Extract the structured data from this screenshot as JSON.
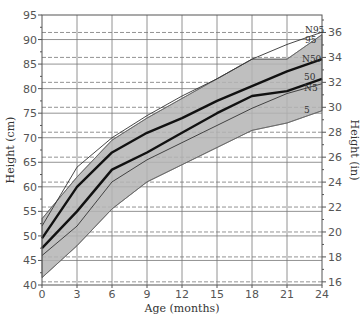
{
  "chart_data": {
    "type": "line",
    "title": "",
    "xlabel": "Age (months)",
    "ylabel": "Height (cm)",
    "ylabel_right": "Height (in)",
    "x": [
      0,
      3,
      6,
      9,
      12,
      15,
      18,
      21,
      24
    ],
    "xticks": [
      0,
      3,
      6,
      9,
      12,
      15,
      18,
      21,
      24
    ],
    "xlim": [
      0,
      24
    ],
    "yticks_left": [
      40,
      45,
      50,
      55,
      60,
      65,
      70,
      75,
      80,
      85,
      90,
      95
    ],
    "ylim": [
      40,
      95
    ],
    "yticks_right": [
      16,
      18,
      20,
      22,
      24,
      26,
      28,
      30,
      32,
      34,
      36
    ],
    "ylim_right_in": [
      15.75,
      37.4
    ],
    "grid": true,
    "shaded_band": {
      "name": "5th–95th percentile range",
      "color": "#b4b4b4",
      "upper": [
        53.5,
        62,
        69.5,
        74,
        78,
        82,
        86,
        86,
        91
      ],
      "lower": [
        41.5,
        48,
        55.5,
        61,
        64.5,
        68,
        71.5,
        73,
        75.5
      ]
    },
    "series": [
      {
        "name": "95",
        "label": "95",
        "style": "band-edge",
        "values": [
          53.5,
          62,
          69.5,
          74,
          78,
          82,
          86,
          86,
          91
        ]
      },
      {
        "name": "N95",
        "label": "N95",
        "style": "thin",
        "values": [
          52,
          64,
          70,
          74.5,
          78.5,
          82,
          86,
          89,
          91.5
        ]
      },
      {
        "name": "N50",
        "label": "N50",
        "style": "thick",
        "values": [
          49.5,
          60,
          67,
          71,
          74,
          77.5,
          80.5,
          83.5,
          86
        ]
      },
      {
        "name": "50",
        "label": "50",
        "style": "thick",
        "values": [
          47.5,
          55,
          63.5,
          67,
          71,
          75,
          78.5,
          79.5,
          82
        ]
      },
      {
        "name": "N5",
        "label": "N5",
        "style": "thin",
        "values": [
          46,
          52,
          61,
          65.5,
          69,
          72.5,
          76,
          79,
          81
        ]
      },
      {
        "name": "5",
        "label": "5",
        "style": "band-edge",
        "values": [
          41.5,
          48,
          55.5,
          61,
          64.5,
          68,
          71.5,
          73,
          75.5
        ]
      }
    ],
    "curve_label_positions": {
      "N95": [
        305,
        33
      ],
      "95": [
        305,
        43
      ],
      "N50": [
        302,
        62
      ],
      "50": [
        304,
        80
      ],
      "N5": [
        304,
        91
      ],
      "5": [
        304,
        113
      ]
    }
  }
}
